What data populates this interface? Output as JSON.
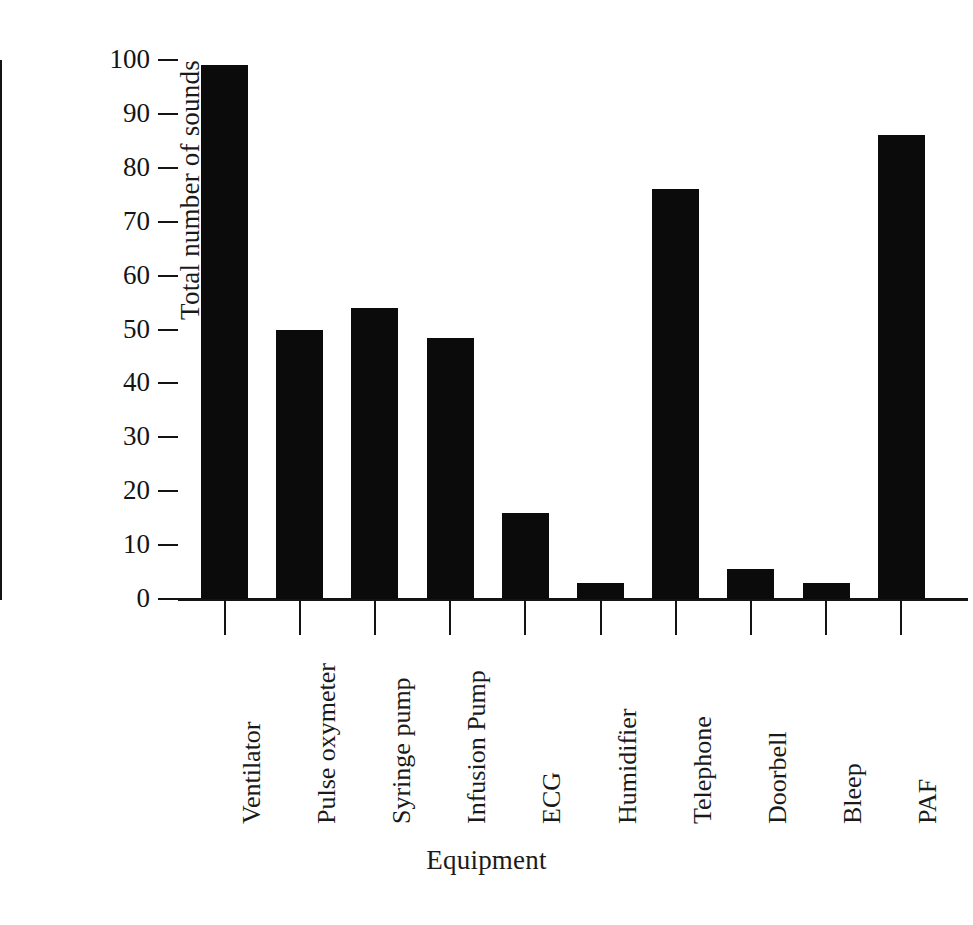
{
  "chart_data": {
    "type": "bar",
    "title": "",
    "xlabel": "Equipment",
    "ylabel": "Total number of sounds",
    "categories": [
      "Ventilator",
      "Pulse oxymeter",
      "Syringe pump",
      "Infusion Pump",
      "ECG",
      "Humidifier",
      "Telephone",
      "Doorbell",
      "Bleep",
      "PAF"
    ],
    "values": [
      99,
      50,
      54,
      48.5,
      16,
      3,
      76,
      5.5,
      3,
      86
    ],
    "ylim": [
      0,
      100
    ],
    "yticks": [
      0,
      10,
      20,
      30,
      40,
      50,
      60,
      70,
      80,
      90,
      100
    ],
    "ytick_labels": [
      "0",
      "10",
      "20",
      "30",
      "40",
      "50",
      "60",
      "70",
      "80",
      "90",
      "100"
    ],
    "grid": false,
    "legend": null,
    "bar_color": "#0b0b0b",
    "axis_color": "#141414"
  }
}
